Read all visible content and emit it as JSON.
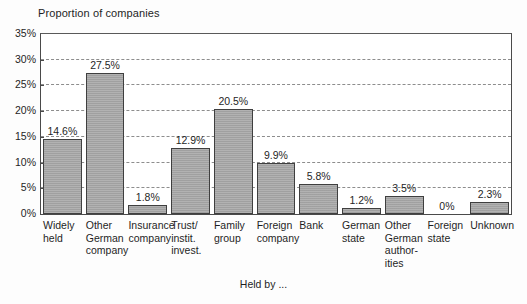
{
  "chart_data": {
    "type": "bar",
    "title": "Proportion of companies",
    "xlabel": "Held by ...",
    "ylabel": "",
    "grid": true,
    "legend": "none",
    "ylim": [
      0,
      35
    ],
    "ytick_labels": [
      "35%",
      "30%",
      "25%",
      "20%",
      "15%",
      "10%",
      "5%",
      "0%"
    ],
    "ytick_values": [
      35,
      30,
      25,
      20,
      15,
      10,
      5,
      0
    ],
    "categories": [
      "Widely held",
      "Other German company",
      "Insurance company",
      "Trust/ instit. invest.",
      "Family group",
      "Foreign company",
      "Bank",
      "German state",
      "Other German author- ities",
      "Foreign state",
      "Unknown"
    ],
    "category_lines": [
      [
        "Widely",
        "held"
      ],
      [
        "Other",
        "German",
        "company"
      ],
      [
        "Insurance",
        "company"
      ],
      [
        "Trust/",
        "instit.",
        "invest."
      ],
      [
        "Family",
        "group"
      ],
      [
        "Foreign",
        "company"
      ],
      [
        "Bank"
      ],
      [
        "German",
        "state"
      ],
      [
        "Other",
        "German",
        "author-",
        "ities"
      ],
      [
        "Foreign",
        "state"
      ],
      [
        "Unknown"
      ]
    ],
    "values": [
      14.6,
      27.5,
      1.8,
      12.9,
      20.5,
      9.9,
      5.8,
      1.2,
      3.5,
      0,
      2.3
    ],
    "value_labels": [
      "14.6%",
      "27.5%",
      "1.8%",
      "12.9%",
      "20.5%",
      "9.9%",
      "5.8%",
      "1.2%",
      "3.5%",
      "0%",
      "2.3%"
    ],
    "bar_color": "#a9a9a9",
    "bar_border_color": "#3f3f3f",
    "grid_color": "#8d8d8d",
    "axis_color": "#4a4a4a"
  }
}
